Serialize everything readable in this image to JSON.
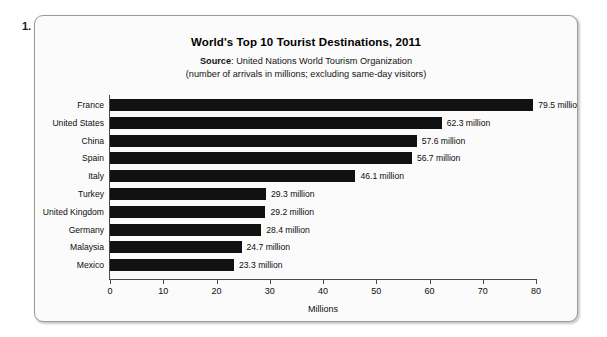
{
  "item_number": "1.",
  "chart_data": {
    "type": "bar",
    "orientation": "horizontal",
    "title": "World's Top 10 Tourist Destinations, 2011",
    "source_prefix": "Source",
    "source_separator": ":",
    "source_text": "United Nations World Tourism Organization",
    "subnote": "(number of arrivals in millions; excluding same-day visitors)",
    "categories": [
      "France",
      "United States",
      "China",
      "Spain",
      "Italy",
      "Turkey",
      "United Kingdom",
      "Germany",
      "Malaysia",
      "Mexico"
    ],
    "values": [
      79.5,
      62.3,
      57.6,
      56.7,
      46.1,
      29.3,
      29.2,
      28.4,
      24.7,
      23.3
    ],
    "value_labels": [
      "79.5 million",
      "62.3 million",
      "57.6 million",
      "56.7 million",
      "46.1 million",
      "29.3 million",
      "29.2 million",
      "28.4 million",
      "24.7 million",
      "23.3 million"
    ],
    "xlabel": "Millions",
    "ylabel": "",
    "xlim": [
      0,
      80
    ],
    "xticks": [
      0,
      10,
      20,
      30,
      40,
      50,
      60,
      70,
      80
    ],
    "xtick_labels": [
      "0",
      "10",
      "20",
      "30",
      "40",
      "50",
      "60",
      "70",
      "80"
    ],
    "grid": false,
    "legend": false,
    "bar_color": "#111111",
    "axis_color": "#4a4a4a",
    "background_color": "#fbfbfb"
  }
}
